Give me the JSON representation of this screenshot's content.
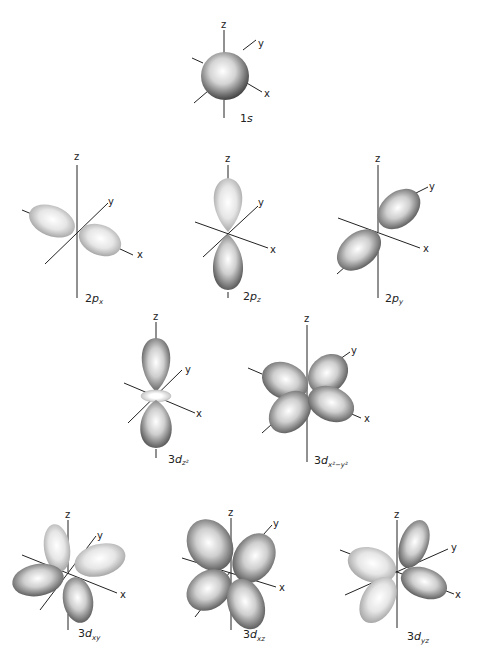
{
  "figure": {
    "axis_labels": {
      "x": "x",
      "y": "y",
      "z": "z"
    },
    "orbitals": [
      {
        "id": "1s",
        "main": "1",
        "letter": "s",
        "subscript": ""
      },
      {
        "id": "2px",
        "main": "2",
        "letter": "p",
        "subscript": "x"
      },
      {
        "id": "2pz",
        "main": "2",
        "letter": "p",
        "subscript": "z"
      },
      {
        "id": "2py",
        "main": "2",
        "letter": "p",
        "subscript": "y"
      },
      {
        "id": "3dz2",
        "main": "3",
        "letter": "d",
        "subscript": "z²"
      },
      {
        "id": "3dx2-y2",
        "main": "3",
        "letter": "d",
        "subscript": "x²−y²"
      },
      {
        "id": "3dxy",
        "main": "3",
        "letter": "d",
        "subscript": "xy"
      },
      {
        "id": "3dxz",
        "main": "3",
        "letter": "d",
        "subscript": "xz"
      },
      {
        "id": "3dyz",
        "main": "3",
        "letter": "d",
        "subscript": "yz"
      }
    ]
  }
}
